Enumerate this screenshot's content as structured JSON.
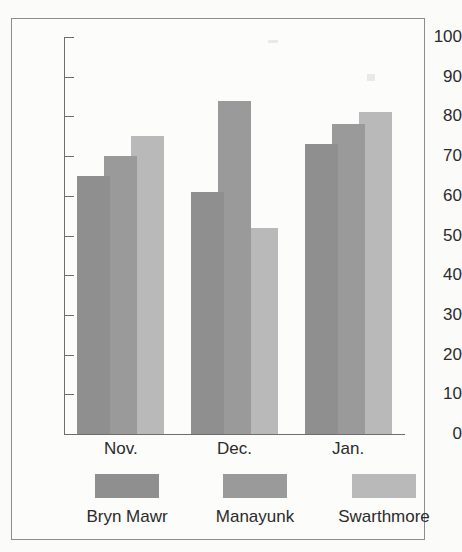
{
  "chart_data": {
    "type": "bar",
    "title": "",
    "subtitle": "",
    "xlabel": "",
    "ylabel": "",
    "categories": [
      "Nov.",
      "Dec.",
      "Jan."
    ],
    "series": [
      {
        "name": "Bryn Mawr",
        "color": "#8f8f8f",
        "values": [
          65,
          61,
          73
        ]
      },
      {
        "name": "Manayunk",
        "color": "#9a9a9a",
        "values": [
          70,
          84,
          78
        ]
      },
      {
        "name": "Swarthmore",
        "color": "#b9b9b9",
        "values": [
          75,
          52,
          81
        ]
      }
    ],
    "ylim": [
      0,
      100
    ],
    "ytick_step": 10,
    "ytick_labels": [
      "100",
      "90",
      "80",
      "70",
      "60",
      "50",
      "40",
      "30",
      "20",
      "10",
      "0"
    ],
    "grid": false,
    "legend_position": "bottom",
    "bar_overlap": true,
    "annotations": []
  },
  "axis": {
    "y_ticks": [
      "100",
      "90",
      "80",
      "70",
      "60",
      "50",
      "40",
      "30",
      "20",
      "10",
      "0"
    ],
    "x_categories": [
      "Nov.",
      "Dec.",
      "Jan."
    ]
  },
  "legend": {
    "items": [
      {
        "label": "Bryn Mawr",
        "color": "#8f8f8f"
      },
      {
        "label": "Manayunk",
        "color": "#9a9a9a"
      },
      {
        "label": "Swarthmore",
        "color": "#b9b9b9"
      }
    ]
  },
  "colors": {
    "series_1": "#8f8f8f",
    "series_2": "#9a9a9a",
    "series_3": "#b9b9b9",
    "axis": "#6e6e6e",
    "frame": "#8d8d8d",
    "text": "#2b2b2b",
    "background": "#fbfbfa"
  }
}
